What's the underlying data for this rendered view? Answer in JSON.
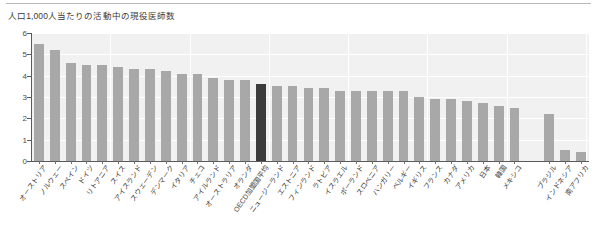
{
  "chart_data": {
    "type": "bar",
    "title": "人口1,000人当たりの活動中の現役医師数",
    "xlabel": "",
    "ylabel": "",
    "ylim": [
      0,
      6
    ],
    "yticks": [
      0,
      1,
      2,
      3,
      4,
      5,
      6
    ],
    "grid": true,
    "legend": null,
    "highlight_category": "OECD加盟国平均",
    "highlight_color": "#3c3c3c",
    "bar_color": "#a8a8a8",
    "plot_background": "#f1f1f1",
    "categories": [
      "オーストリア",
      "ノルウェー",
      "スペイン",
      "ドイツ",
      "リトアニア",
      "スイス",
      "アイスランド",
      "スウェーデン",
      "デンマーク",
      "イタリア",
      "チェコ",
      "アイルランド",
      "オーストラリア",
      "オランダ",
      "OECD加盟国平均",
      "ニュージーランド",
      "エストニア",
      "フィンランド",
      "ラトビア",
      "イスラエル",
      "ポーランド",
      "スロベニア",
      "ハンガリー",
      "ベルギー",
      "イギリス",
      "フランス",
      "カナダ",
      "アメリカ",
      "日本",
      "韓国",
      "メキシコ",
      "ブラジル",
      "インドネシア",
      "南アフリカ"
    ],
    "values": [
      5.5,
      5.2,
      4.6,
      4.5,
      4.5,
      4.4,
      4.3,
      4.3,
      4.2,
      4.1,
      4.1,
      3.9,
      3.8,
      3.8,
      3.6,
      3.5,
      3.5,
      3.4,
      3.4,
      3.3,
      3.3,
      3.3,
      3.3,
      3.3,
      3.0,
      2.9,
      2.9,
      2.8,
      2.7,
      2.6,
      2.5,
      2.2,
      0.5,
      0.4
    ],
    "gap_before": "ブラジル"
  },
  "figure": {
    "title_text": "人口1,000人当たりの活動中の現役医師数"
  }
}
